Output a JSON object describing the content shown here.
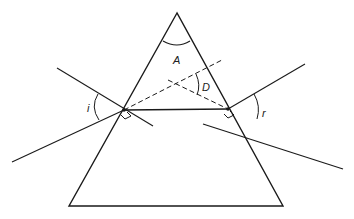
{
  "diagram": {
    "labels": {
      "apex_angle": "A",
      "deviation": "D",
      "incidence": "i",
      "emergence": "r"
    },
    "colors": {
      "line": "#1a1a1a",
      "background": "#ffffff"
    },
    "geometry": {
      "apex": [
        177,
        13
      ],
      "base_left": [
        69,
        206
      ],
      "base_right": [
        283,
        206
      ],
      "entry_point": [
        124,
        110
      ],
      "exit_point": [
        228,
        109
      ]
    }
  }
}
